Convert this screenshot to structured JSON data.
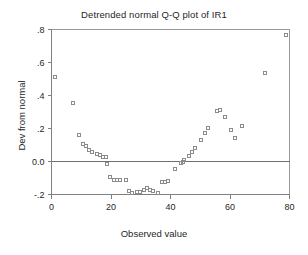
{
  "chart_data": {
    "type": "scatter",
    "title": "Detrended normal Q-Q plot of IR1",
    "xlabel": "Observed value",
    "ylabel": "Dev from normal",
    "xlim": [
      0,
      80
    ],
    "ylim": [
      -0.2,
      0.8
    ],
    "xticks": [
      0,
      20,
      40,
      60,
      80
    ],
    "xtick_labels": [
      "0",
      "20",
      "40",
      "60",
      "80"
    ],
    "yticks": [
      -0.2,
      0.0,
      0.2,
      0.4,
      0.6,
      0.8
    ],
    "ytick_labels": [
      "-.2",
      "0.0",
      ".2",
      ".4",
      ".6",
      ".8"
    ],
    "grid": false,
    "legend": null,
    "reference_line": {
      "type": "horizontal",
      "y": 0.0
    },
    "marker": "open-square",
    "marker_color": "#8b8b8b",
    "series": [
      {
        "name": "IR1",
        "points": [
          [
            1.0,
            0.515
          ],
          [
            7.0,
            0.355
          ],
          [
            9.0,
            0.162
          ],
          [
            10.5,
            0.112
          ],
          [
            11.5,
            0.095
          ],
          [
            12.5,
            0.072
          ],
          [
            13.5,
            0.062
          ],
          [
            15.0,
            0.048
          ],
          [
            16.0,
            0.042
          ],
          [
            17.0,
            0.033
          ],
          [
            18.0,
            0.028
          ],
          [
            18.5,
            -0.012
          ],
          [
            19.5,
            -0.092
          ],
          [
            21.0,
            -0.108
          ],
          [
            22.0,
            -0.108
          ],
          [
            23.0,
            -0.107
          ],
          [
            25.0,
            -0.112
          ],
          [
            26.0,
            -0.175
          ],
          [
            27.0,
            -0.188
          ],
          [
            28.5,
            -0.183
          ],
          [
            29.5,
            -0.182
          ],
          [
            31.0,
            -0.172
          ],
          [
            32.0,
            -0.158
          ],
          [
            33.0,
            -0.172
          ],
          [
            34.0,
            -0.175
          ],
          [
            35.5,
            -0.185
          ],
          [
            37.0,
            -0.122
          ],
          [
            38.0,
            -0.122
          ],
          [
            39.0,
            -0.115
          ],
          [
            41.5,
            -0.04
          ],
          [
            43.5,
            -0.008
          ],
          [
            44.0,
            -0.002
          ],
          [
            44.5,
            0.012
          ],
          [
            46.0,
            0.035
          ],
          [
            47.0,
            0.062
          ],
          [
            48.0,
            0.082
          ],
          [
            50.0,
            0.135
          ],
          [
            51.5,
            0.175
          ],
          [
            52.5,
            0.205
          ],
          [
            55.5,
            0.312
          ],
          [
            56.5,
            0.318
          ],
          [
            58.0,
            0.275
          ],
          [
            60.0,
            0.195
          ],
          [
            61.5,
            0.148
          ],
          [
            64.0,
            0.218
          ],
          [
            71.5,
            0.54
          ],
          [
            78.5,
            0.77
          ]
        ]
      }
    ]
  }
}
